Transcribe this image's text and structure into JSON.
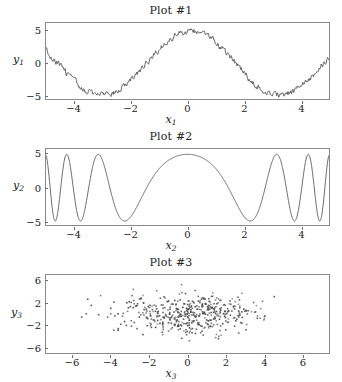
{
  "figure": {
    "width": 342,
    "height": 382,
    "background": "#ffffff",
    "line_color": "#555555",
    "marker_color": "#4a4a4a",
    "frame_color": "#8a8a8a"
  },
  "panels": [
    {
      "id": "plot-1",
      "title": "Plot #1",
      "xlabel": "x",
      "xlabel_sub": "1",
      "ylabel": "y",
      "ylabel_sub": "1",
      "xticks": [
        "-4",
        "-2",
        "0",
        "2",
        "4"
      ],
      "xtick_values": [
        -4,
        -2,
        0,
        2,
        4
      ],
      "yticks": [
        "5",
        "0",
        "-5"
      ],
      "ytick_values": [
        5,
        0,
        -5
      ]
    },
    {
      "id": "plot-2",
      "title": "Plot #2",
      "xlabel": "x",
      "xlabel_sub": "2",
      "ylabel": "y",
      "ylabel_sub": "2",
      "xticks": [
        "-4",
        "-2",
        "0",
        "2",
        "4"
      ],
      "xtick_values": [
        -4,
        -2,
        0,
        2,
        4
      ],
      "yticks": [
        "5",
        "0",
        "-5"
      ],
      "ytick_values": [
        5,
        0,
        -5
      ]
    },
    {
      "id": "plot-3",
      "title": "Plot #3",
      "xlabel": "x",
      "xlabel_sub": "3",
      "ylabel": "y",
      "ylabel_sub": "3",
      "xticks": [
        "-6",
        "-4",
        "-2",
        "0",
        "2",
        "4",
        "6"
      ],
      "xtick_values": [
        -6,
        -4,
        -2,
        0,
        2,
        4,
        6
      ],
      "yticks": [
        "6",
        "2",
        "-2",
        "-6"
      ],
      "ytick_values": [
        6,
        2,
        -2,
        -6
      ]
    }
  ],
  "chart_data": [
    {
      "type": "line",
      "title": "Plot #1",
      "xlabel": "x1",
      "ylabel": "y1",
      "xlim": [
        -5,
        5
      ],
      "ylim": [
        -5.6,
        6.2
      ],
      "grid": false,
      "legend": null,
      "description": "Noisy sinusoid, amplitude about 5, roughly one and a half periods across x from -5 to 5, with small high-frequency jitter riding on the smooth wave.",
      "model": "y = 5*sin(x + 1.45) + noise(amplitude~0.45)",
      "series": [
        {
          "name": "y1",
          "color": "#555555",
          "amplitude": 5,
          "phase": 1.45,
          "angular_frequency": 1.0,
          "noise_amplitude": 0.45,
          "n_points": 400
        }
      ]
    },
    {
      "type": "line",
      "title": "Plot #2",
      "xlabel": "x2",
      "ylabel": "y2",
      "xlim": [
        -5,
        5
      ],
      "ylim": [
        -5.6,
        5.8
      ],
      "grid": false,
      "legend": null,
      "description": "Symmetric chirp: smooth oscillation of constant amplitude 5 whose frequency is lowest at x=0 and increases toward both edges; about 4 full oscillations on each side.",
      "model": "y = 5*cos(0.11*x^3 + 0.9*x) approximately; frequency grows with |x|",
      "series": [
        {
          "name": "y2",
          "color": "#555555",
          "amplitude": 5,
          "chirp_cubic_coeff": 0.115,
          "chirp_linear_coeff": 0.85,
          "n_points": 1200
        }
      ]
    },
    {
      "type": "scatter",
      "title": "Plot #3",
      "xlabel": "x3",
      "ylabel": "y3",
      "xlim": [
        -7.4,
        7.4
      ],
      "ylim": [
        -7,
        7
      ],
      "grid": false,
      "legend": null,
      "description": "Dense bivariate-normal cloud of roughly 500 small dark points centred near the origin; wider horizontal spread than vertical, with sparse outliers near the left and right edges.",
      "marker": {
        "shape": "square-dot",
        "size_px": 1.6,
        "color": "#4a4a4a"
      },
      "n_points": 500,
      "x_mean": 0,
      "x_std": 1.9,
      "y_mean": 0,
      "y_std": 1.7
    }
  ]
}
